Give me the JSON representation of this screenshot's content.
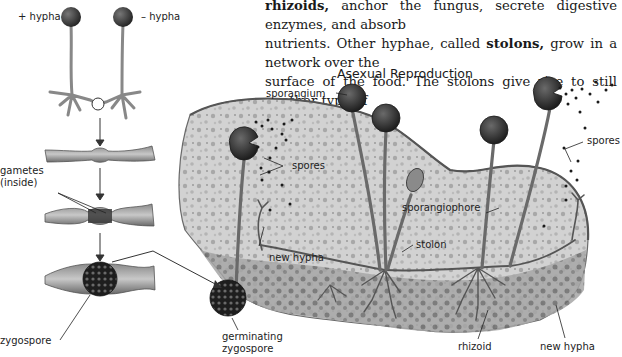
{
  "body_text": {
    "line1_term": "rhizoids,",
    "line1_rest": " anchor the fungus, secrete digestive enzymes, and absorb",
    "line2_pre": "nutrients. Other hyphae, called ",
    "line2_term": "stolons,",
    "line2_post": " grow in a network over the",
    "line3": "surface of the food. The stolons give rise to still another type of"
  },
  "diagram": {
    "title": "Asexual Reproduction",
    "sexual_labels": {
      "plus_hypha": "+ hypha",
      "minus_hypha": "– hypha",
      "gametes_line1": "gametes",
      "gametes_line2": "(inside)",
      "zygospore": "zygospore",
      "germinating_line1": "germinating",
      "germinating_line2": "zygospore"
    },
    "asexual_labels": {
      "sporangium": "sporangium",
      "spores_left": "spores",
      "spores_right": "spores",
      "sporangiophore": "sporangiophore",
      "stolon": "stolon",
      "new_hypha_center": "new hypha",
      "rhizoid": "rhizoid",
      "new_hypha_right": "new hypha"
    },
    "colors": {
      "ink": "#222222",
      "bread": "#cfcfcf",
      "bread_dark": "#8c8c8c",
      "sporangium": "#3a3a3a",
      "hypha": "#9a9a9a"
    }
  }
}
